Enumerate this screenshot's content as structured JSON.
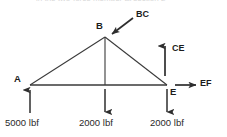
{
  "figure": {
    "type": "free-body-diagram",
    "background_color": "#ffffff",
    "line_color": "#3a3a3a",
    "text_color": "#1c1c1c",
    "cropped_header_text": "in the two-force member at section 2",
    "joints": [
      {
        "id": "A",
        "label": "A",
        "x": 30,
        "y": 85
      },
      {
        "id": "B",
        "label": "B",
        "x": 105,
        "y": 37
      },
      {
        "id": "E",
        "label": "E",
        "x": 167,
        "y": 85
      }
    ],
    "members": [
      {
        "name": "member-ab",
        "from": "A",
        "to": "B"
      },
      {
        "name": "member-be",
        "from": "B",
        "to": "E"
      },
      {
        "name": "member-ae",
        "from": "A",
        "to": "E"
      },
      {
        "name": "member-b-midpoint",
        "from": "B",
        "to": "baseline-midpoint"
      }
    ],
    "force_labels": [
      {
        "id": "BC",
        "label": "BC",
        "direction": "down-left",
        "applied_at": "B"
      },
      {
        "id": "CE",
        "label": "CE",
        "direction": "up",
        "applied_at": "E"
      },
      {
        "id": "EF",
        "label": "EF",
        "direction": "right",
        "applied_at": "E"
      }
    ],
    "applied_loads": [
      {
        "id": "load-a",
        "magnitude": "5000 lbf",
        "direction": "up",
        "at_joint": "A"
      },
      {
        "id": "load-center",
        "magnitude": "2000 lbf",
        "direction": "down",
        "at_joint": "midpoint"
      },
      {
        "id": "load-e",
        "magnitude": "2000 lbf",
        "direction": "down",
        "at_joint": "E"
      }
    ]
  }
}
